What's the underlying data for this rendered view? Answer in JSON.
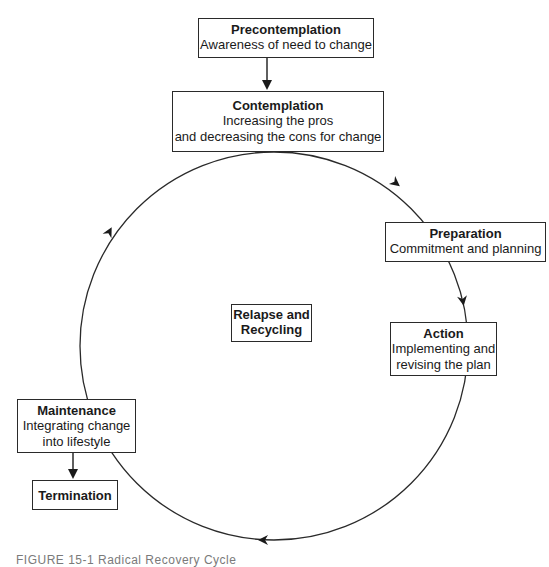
{
  "diagram": {
    "stages": {
      "precontemplation": {
        "title": "Precontemplation",
        "desc": "Awareness of need to change"
      },
      "contemplation": {
        "title": "Contemplation",
        "desc_line1": "Increasing the pros",
        "desc_line2": "and decreasing the cons for change"
      },
      "preparation": {
        "title": "Preparation",
        "desc": "Commitment and planning"
      },
      "action": {
        "title": "Action",
        "desc_line1": "Implementing and",
        "desc_line2": "revising the plan"
      },
      "maintenance": {
        "title": "Maintenance",
        "desc_line1": "Integrating change",
        "desc_line2": "into lifestyle"
      },
      "termination": {
        "title": "Termination"
      }
    },
    "center": {
      "line1": "Relapse and",
      "line2": "Recycling"
    },
    "cycle": {
      "direction": "clockwise",
      "center_x": 274,
      "center_y": 346,
      "radius": 194
    },
    "colors": {
      "line": "#2a2a2a",
      "background": "#ffffff"
    }
  },
  "caption": {
    "text": "FIGURE 15-1  Radical Recovery Cycle"
  }
}
